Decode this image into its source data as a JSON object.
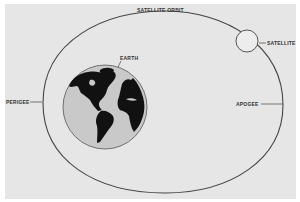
{
  "diagram": {
    "labels": {
      "orbit": "SATELLITE ORBIT",
      "satellite": "SATELLITE",
      "earth": "EARTH",
      "perigee": "PERIGEE",
      "apogee": "APOGEE"
    },
    "colors": {
      "background": "#e6e6e6",
      "stroke": "#444444",
      "earth_ocean": "#c9c9c9",
      "earth_land": "#111111",
      "satellite_fill": "#ededed",
      "text": "#333333"
    }
  }
}
